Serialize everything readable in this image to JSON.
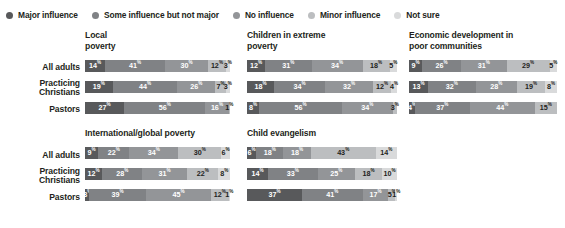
{
  "legend": {
    "items": [
      {
        "label": "Major influence",
        "color": "#58595b"
      },
      {
        "label": "Some influence but not major",
        "color": "#808285"
      },
      {
        "label": "No influence",
        "color": "#939598"
      },
      {
        "label": "Minor influence",
        "color": "#bcbec0"
      },
      {
        "label": "Not sure",
        "color": "#d9dadb"
      }
    ]
  },
  "row_categories": [
    "All adults",
    "Practicing\nChristians",
    "Pastors"
  ],
  "chart_data": {
    "type": "bar",
    "subtype": "stacked-horizontal-100",
    "title": "",
    "xlabel": "",
    "ylabel": "",
    "xlim": [
      0,
      100
    ],
    "grid": false,
    "legend_position": "top",
    "categories": [
      "All adults",
      "Practicing Christians",
      "Pastors"
    ],
    "series_names": [
      "Major influence",
      "Some influence but not major",
      "No influence",
      "Minor influence",
      "Not sure"
    ],
    "series_colors": [
      "#58595b",
      "#808285",
      "#939598",
      "#bcbec0",
      "#d9dadb"
    ],
    "panels": [
      {
        "title": "Local\npoverty",
        "rows": [
          {
            "category": "All adults",
            "values": [
              14,
              41,
              30,
              12,
              3
            ]
          },
          {
            "category": "Practicing Christians",
            "values": [
              19,
              44,
              26,
              7,
              3
            ]
          },
          {
            "category": "Pastors",
            "values": [
              27,
              56,
              16,
              1,
              0
            ]
          }
        ]
      },
      {
        "title": "Children in extreme\npoverty",
        "rows": [
          {
            "category": "All adults",
            "values": [
              12,
              31,
              34,
              18,
              5
            ]
          },
          {
            "category": "Practicing Christians",
            "values": [
              18,
              34,
              32,
              12,
              4
            ]
          },
          {
            "category": "Pastors",
            "values": [
              8,
              56,
              34,
              3,
              0
            ]
          }
        ]
      },
      {
        "title": "Economic development in\npoor communities",
        "rows": [
          {
            "category": "All adults",
            "values": [
              9,
              26,
              31,
              29,
              5
            ]
          },
          {
            "category": "Practicing Christians",
            "values": [
              13,
              32,
              28,
              19,
              8
            ]
          },
          {
            "category": "Pastors",
            "values": [
              4,
              37,
              44,
              15,
              0
            ]
          }
        ]
      },
      {
        "title": "International/global poverty",
        "rows": [
          {
            "category": "All adults",
            "values": [
              9,
              22,
              34,
              30,
              6
            ]
          },
          {
            "category": "Practicing Christians",
            "values": [
              12,
              28,
              31,
              22,
              8
            ]
          },
          {
            "category": "Pastors",
            "values": [
              3,
              39,
              45,
              12,
              1
            ]
          }
        ]
      },
      {
        "title": "Child evangelism",
        "rows": [
          {
            "category": "All adults",
            "values": [
              6,
              18,
              18,
              43,
              14
            ]
          },
          {
            "category": "Practicing Christians",
            "values": [
              14,
              33,
              25,
              18,
              10
            ]
          },
          {
            "category": "Pastors",
            "values": [
              37,
              41,
              17,
              5,
              1
            ]
          }
        ]
      }
    ]
  },
  "layout": {
    "panel_positions": [
      {
        "left": 85,
        "top": 30,
        "bar_left": 0,
        "bar_width": 145,
        "bars_top": 30
      },
      {
        "left": 247,
        "top": 30,
        "bar_left": 0,
        "bar_width": 150,
        "bars_top": 30
      },
      {
        "left": 409,
        "top": 30,
        "bar_left": 0,
        "bar_width": 148,
        "bars_top": 30
      },
      {
        "left": 85,
        "top": 128,
        "bar_left": 0,
        "bar_width": 145,
        "bars_top": 19
      },
      {
        "left": 247,
        "top": 128,
        "bar_left": 0,
        "bar_width": 150,
        "bars_top": 19
      }
    ],
    "row_offsets": [
      0,
      21,
      42
    ],
    "label_groups": [
      {
        "left": 2,
        "top": 62
      },
      {
        "left": 2,
        "top": 150
      }
    ]
  }
}
